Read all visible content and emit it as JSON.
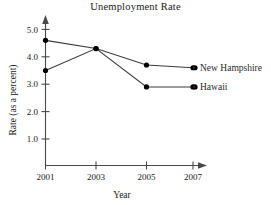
{
  "chart_data": {
    "type": "line",
    "title": "Unemployment Rate",
    "xlabel": "Year",
    "ylabel": "Rate (as a percent)",
    "x": [
      2001,
      2003,
      2005,
      2007
    ],
    "xticklabels": [
      "2001",
      "2003",
      "2005",
      "2007"
    ],
    "yticks": [
      1.0,
      2.0,
      3.0,
      4.0,
      5.0
    ],
    "yticklabels": [
      "1.0",
      "2.0",
      "3.0",
      "4.0",
      "5.0"
    ],
    "ylim": [
      0,
      5.6
    ],
    "xlim": [
      2000.4,
      2008.0
    ],
    "grid": false,
    "legend_position": "right-inline-labels",
    "series": [
      {
        "name": "New Hampshire",
        "values": [
          4.6,
          4.3,
          3.7,
          3.6
        ],
        "color": "#3c3c3c",
        "marker": "circle"
      },
      {
        "name": "Hawaii",
        "values": [
          3.5,
          4.3,
          2.9,
          2.9
        ],
        "color": "#3c3c3c",
        "marker": "circle"
      }
    ]
  },
  "labels": {
    "series_0": "New Hampshire",
    "series_1": "Hawaii"
  },
  "colors": {
    "line": "#3c3c3c",
    "axis": "#4a4a4a",
    "text": "#1a1a1a",
    "series_label": "#2b2b2b",
    "background": "#ffffff"
  }
}
